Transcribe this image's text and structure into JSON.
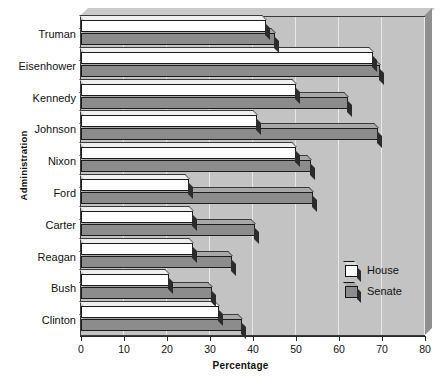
{
  "chart_data": {
    "type": "bar",
    "orientation": "horizontal",
    "title": "",
    "xlabel": "Percentage",
    "ylabel": "Administration",
    "xlim": [
      0,
      80
    ],
    "xticks": [
      0,
      10,
      20,
      30,
      40,
      50,
      60,
      70,
      80
    ],
    "grid": true,
    "legend_position": "bottom-right",
    "categories": [
      "Truman",
      "Eisenhower",
      "Kennedy",
      "Johnson",
      "Nixon",
      "Ford",
      "Carter",
      "Reagan",
      "Bush",
      "Clinton"
    ],
    "series": [
      {
        "name": "House",
        "color": "#ffffff",
        "values": [
          43,
          68,
          50,
          41,
          50,
          25,
          26,
          26,
          20.5,
          32
        ]
      },
      {
        "name": "Senate",
        "color": "#8c8c8c",
        "values": [
          45,
          69.5,
          62,
          69,
          53.5,
          54,
          40.5,
          35,
          30.5,
          37.5
        ]
      }
    ]
  },
  "legend": {
    "items": [
      {
        "label": "House",
        "swatch": "white-cube-swatch"
      },
      {
        "label": "Senate",
        "swatch": "gray-cube-swatch"
      }
    ]
  },
  "axes": {
    "x_title": "Percentage",
    "y_title": "Administration",
    "x_tick_labels": [
      "0",
      "10",
      "20",
      "30",
      "40",
      "50",
      "60",
      "70",
      "80"
    ],
    "y_tick_labels": [
      "Truman",
      "Eisenhower",
      "Kennedy",
      "Johnson",
      "Nixon",
      "Ford",
      "Carter",
      "Reagan",
      "Bush",
      "Clinton"
    ]
  },
  "colors": {
    "plot_background": "#c3c3c3",
    "house_bar": "#ffffff",
    "senate_bar": "#8c8c8c",
    "axis": "#2b2b2b",
    "gridline": "#e8e8e8"
  }
}
